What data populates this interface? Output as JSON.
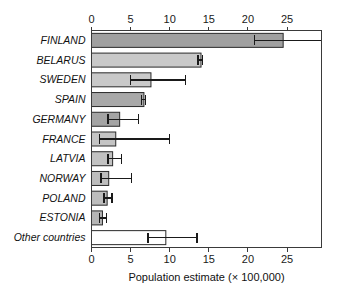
{
  "chart_data": {
    "type": "bar",
    "orientation": "horizontal",
    "title": "",
    "subtitle": "",
    "xlabel": "Population estimate (× 100,000)",
    "ylabel": "",
    "xlim": [
      0,
      29.4
    ],
    "xticks": [
      0,
      5,
      10,
      15,
      20,
      25
    ],
    "xtick_labels": [
      "0",
      "5",
      "10",
      "15",
      "20",
      "25"
    ],
    "top_axis": true,
    "bottom_axis": true,
    "grid": false,
    "legend": null,
    "categories": [
      "FINLAND",
      "BELARUS",
      "SWEDEN",
      "SPAIN",
      "GERMANY",
      "FRANCE",
      "LATVIA",
      "NORWAY",
      "POLAND",
      "ESTONIA",
      "Other countries"
    ],
    "values": [
      24.5,
      14.0,
      7.6,
      6.7,
      3.6,
      3.1,
      2.7,
      2.2,
      2.0,
      1.4,
      9.5
    ],
    "error_low": [
      20.8,
      13.6,
      5.0,
      6.4,
      2.1,
      1.0,
      2.1,
      1.2,
      1.6,
      1.0,
      7.2
    ],
    "error_high": [
      29.4,
      14.2,
      12.0,
      6.9,
      6.0,
      10.0,
      3.8,
      5.1,
      2.6,
      1.9,
      13.5
    ],
    "bar_colors": [
      "#a0a0a0",
      "#c9c9c9",
      "#c9c9c9",
      "#a8a8a8",
      "#a4a4a4",
      "#c4c4c4",
      "#c2c2c2",
      "#bdbdbd",
      "#bdbdbd",
      "#b5b5b5",
      "#ffffff"
    ],
    "bar_edge_color": "#2a2a2a",
    "error_bar_color": "#1a1a1a",
    "axis_color": "#3a3a3a",
    "background": "#ffffff"
  }
}
